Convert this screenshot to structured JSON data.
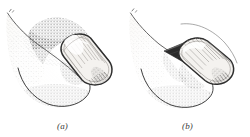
{
  "figure": {
    "type": "anatomical-line-drawing",
    "background_color": "#ffffff",
    "ink_color": "#3a3a3a",
    "stipple_color": "#6b6b6b",
    "shadow_color": "#2a2a2a",
    "nail_fill_color": "#f4f2ef",
    "skin_fill_color": "#fbfaf8",
    "panels": [
      {
        "id": "a",
        "caption": "(a)",
        "description": "Fingertip with intact nail plate; proximal nail fold swollen and darkly stippled",
        "nail_state": "intact",
        "nail_orientation_deg": 28,
        "has_dark_wedge": false,
        "striation_count": 9
      },
      {
        "id": "b",
        "caption": "(b)",
        "description": "Fingertip with nail plate elevated from the nail bed, dark wedge-shaped space beneath the proximal edge",
        "nail_state": "elevated",
        "nail_orientation_deg": 20,
        "has_dark_wedge": true,
        "striation_count": 11
      }
    ]
  }
}
